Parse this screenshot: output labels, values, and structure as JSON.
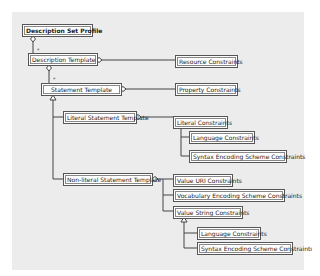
{
  "diagram": {
    "type": "UML class diagram",
    "nodes": {
      "dsp": "Description Set Profile",
      "dt": "Description Template",
      "rc": "Resource Constraints",
      "st": "Statement Template",
      "pc": "Property Constraints",
      "lst": "Literal Statement Template",
      "lc": "Literal Constraints",
      "lc_lang": "Language Constraints",
      "lc_ses": "Syntax Encoding Scheme Constraints",
      "nlst": "Non-literal Statement Template",
      "vuc": "Value URI Constraints",
      "vesc": "Vocabulary Encoding Scheme Constraints",
      "vsc": "Value String Constraints",
      "vsc_lang": "Language Constraints",
      "vsc_ses": "Syntax Encoding Scheme Constraints"
    },
    "multiplicities": {
      "dsp_dt": "*",
      "dt_st": "*"
    },
    "colors": {
      "panel_bg": "#ececec",
      "box_bg": "#ffffff",
      "line": "#444444"
    }
  }
}
